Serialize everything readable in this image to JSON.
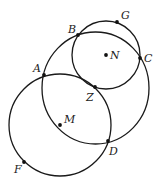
{
  "diagram": {
    "circles": [
      {
        "name": "circle-big",
        "cx": 95.5,
        "cy": 88,
        "rx": 53.5,
        "ry": 56
      },
      {
        "name": "circle-N",
        "cx": 106,
        "cy": 55,
        "rx": 34,
        "ry": 34
      },
      {
        "name": "circle-M",
        "cx": 60,
        "cy": 125,
        "rx": 51,
        "ry": 51
      }
    ],
    "points": [
      {
        "label": "A",
        "x": 44,
        "y": 75,
        "lx": 33,
        "ly": 72
      },
      {
        "label": "B",
        "x": 78,
        "y": 35,
        "lx": 68,
        "ly": 33
      },
      {
        "label": "G",
        "x": 117,
        "y": 22,
        "lx": 121,
        "ly": 19
      },
      {
        "label": "N",
        "x": 106,
        "y": 55,
        "lx": 110,
        "ly": 59
      },
      {
        "label": "C",
        "x": 140,
        "y": 58,
        "lx": 144,
        "ly": 62
      },
      {
        "label": "Z",
        "x": 95,
        "y": 87,
        "lx": 86,
        "ly": 101
      },
      {
        "label": "M",
        "x": 60,
        "y": 125,
        "lx": 64,
        "ly": 123
      },
      {
        "label": "D",
        "x": 108,
        "y": 141,
        "lx": 109,
        "ly": 155
      },
      {
        "label": "F",
        "x": 24,
        "y": 162,
        "lx": 14,
        "ly": 173
      }
    ]
  }
}
